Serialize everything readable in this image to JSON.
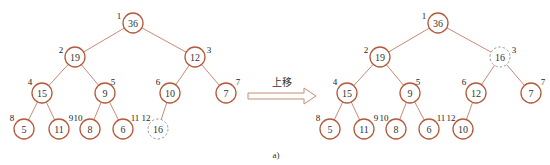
{
  "trees": [
    {
      "name": "before",
      "nodes": [
        {
          "index": "1",
          "value": "36"
        },
        {
          "index": "2",
          "value": "19"
        },
        {
          "index": "3",
          "value": "12"
        },
        {
          "index": "4",
          "value": "15"
        },
        {
          "index": "5",
          "value": "9"
        },
        {
          "index": "6",
          "value": "10"
        },
        {
          "index": "7",
          "value": "7"
        },
        {
          "index": "8",
          "value": "5"
        },
        {
          "index": "9",
          "value": "11"
        },
        {
          "index": "10",
          "value": "8"
        },
        {
          "index": "11",
          "value": "6"
        },
        {
          "index": "12",
          "value": "16",
          "highlight": true
        }
      ]
    },
    {
      "name": "after",
      "nodes": [
        {
          "index": "1",
          "value": "36"
        },
        {
          "index": "2",
          "value": "19"
        },
        {
          "index": "3",
          "value": "16",
          "highlight": true
        },
        {
          "index": "4",
          "value": "15"
        },
        {
          "index": "5",
          "value": "9"
        },
        {
          "index": "6",
          "value": "12"
        },
        {
          "index": "7",
          "value": "7"
        },
        {
          "index": "8",
          "value": "5"
        },
        {
          "index": "9",
          "value": "11"
        },
        {
          "index": "10",
          "value": "8"
        },
        {
          "index": "11",
          "value": "6"
        },
        {
          "index": "12",
          "value": "10"
        }
      ]
    }
  ],
  "arrow": {
    "label": "上移"
  },
  "caption": "a)"
}
